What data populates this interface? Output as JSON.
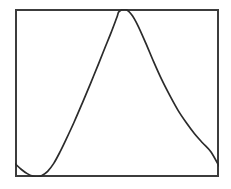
{
  "figure": {
    "background_color": "#ffffff",
    "frame_color": "#3c3c3c",
    "gridline_color": "#a8a8a8",
    "curve_color": "#2b2b2b"
  },
  "chart_data": {
    "type": "line",
    "title": "",
    "subtitle": "",
    "xlabel": "",
    "ylabel": "",
    "legend": [],
    "legend_position": "none",
    "grid": true,
    "grid_columns": 10,
    "grid_rows": 8,
    "xlim": [
      0,
      10
    ],
    "ylim": [
      0,
      8
    ],
    "xticks": [
      0,
      1,
      2,
      3,
      4,
      5,
      6,
      7,
      8,
      9,
      10
    ],
    "yticks": [
      0,
      1,
      2,
      3,
      4,
      5,
      6,
      7,
      8
    ],
    "xtick_labels": [],
    "ytick_labels": [],
    "annotations": [],
    "series": [
      {
        "name": "curve",
        "x": [
          0.0,
          0.3,
          0.6,
          0.9,
          1.08,
          1.3,
          1.6,
          1.9,
          2.2,
          2.5,
          2.9,
          3.3,
          3.7,
          4.1,
          4.4,
          4.7,
          5.0,
          5.1,
          5.4,
          5.7,
          6.0,
          6.4,
          6.8,
          7.2,
          7.6,
          8.0,
          8.4,
          8.8,
          9.2,
          9.6,
          10.0
        ],
        "y": [
          0.64,
          0.37,
          0.16,
          0.03,
          0.0,
          0.06,
          0.27,
          0.65,
          1.18,
          1.78,
          2.62,
          3.52,
          4.45,
          5.4,
          6.13,
          6.85,
          7.62,
          7.87,
          7.99,
          7.75,
          7.26,
          6.4,
          5.48,
          4.62,
          3.86,
          3.16,
          2.58,
          2.06,
          1.62,
          1.2,
          0.52
        ]
      }
    ]
  }
}
